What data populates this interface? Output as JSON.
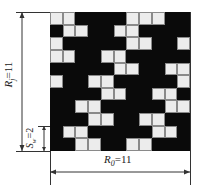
{
  "diagram": {
    "type": "weave-repeat-pattern",
    "grid": {
      "rows": 11,
      "cols": 11,
      "legend": {
        "W": "light square",
        "B": "dark square"
      },
      "colors": {
        "dark": "#0a0a0a",
        "light": "#ececec",
        "cell_border": "#8a8a8a"
      },
      "pattern": [
        "WWBBBBWWWBB",
        "BWWBBWWBBBB",
        "WBBBBBWWBBW",
        "WWBBWWBBBBB",
        "BBBBBWWBBWW",
        "WBBWWBBBBBW",
        "BBBBWWBBWWB",
        "BBWWBBBBBWW",
        "BBBWWBBWWBB",
        "BWWBBBBBWWB",
        "BBWWBBWWBBB"
      ]
    },
    "labels": {
      "rj_symbol": "R",
      "rj_sub": "j",
      "rj_value": "=11",
      "ro_symbol": "R",
      "ro_sub": "0",
      "ro_value": "=11",
      "s_symbol": "S",
      "s_sub": "w",
      "s_value": "=2"
    }
  }
}
